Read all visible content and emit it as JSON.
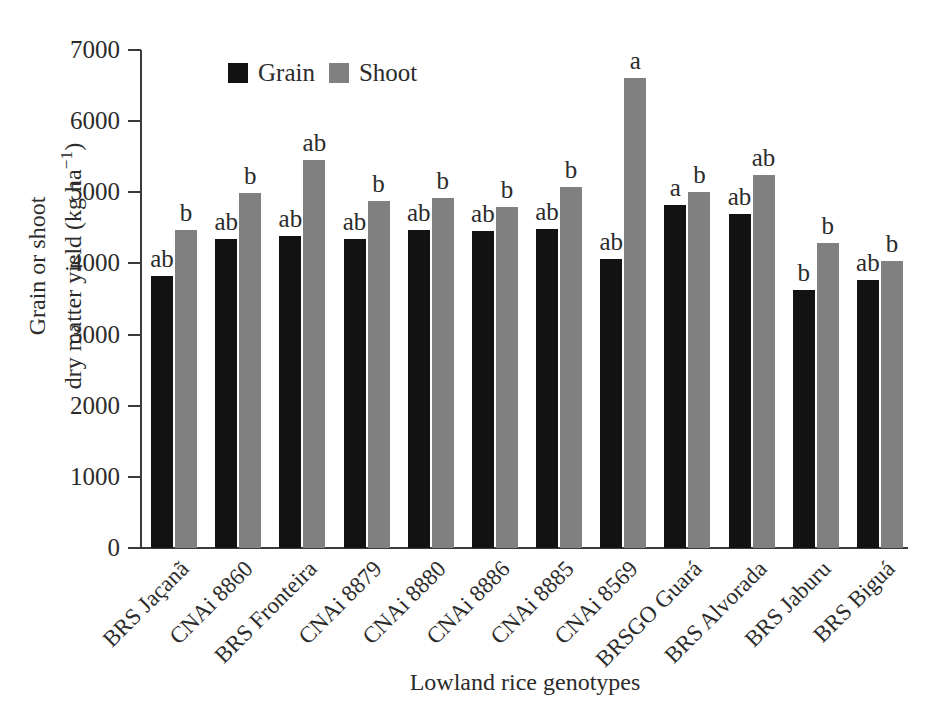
{
  "chart_data": {
    "type": "bar",
    "title": "",
    "xlabel": "Lowland rice genotypes",
    "ylabel_line1": "Grain or shoot",
    "ylabel_line2_pre": "dry matter yield (kg ha",
    "ylabel_line2_sup": "−1",
    "ylabel_line2_post": ")",
    "ylim": [
      0,
      7000
    ],
    "yticks": [
      0,
      1000,
      2000,
      3000,
      4000,
      5000,
      6000,
      7000
    ],
    "ytick_labels": [
      "0",
      "1000",
      "2000",
      "3000",
      "4000",
      "5000",
      "6000",
      "7000"
    ],
    "grid": false,
    "legend_position": "top-left-inside",
    "categories": [
      "BRS Jaçanã",
      "CNAi 8860",
      "BRS Fronteira",
      "CNAi 8879",
      "CNAi 8880",
      "CNAi 8886",
      "CNAi 8885",
      "CNAi 8569",
      "BRSGO Guará",
      "BRS Alvorada",
      "BRS Jaburu",
      "BRS Biguá"
    ],
    "series": [
      {
        "name": "Grain",
        "color": "#121212",
        "values": [
          3820,
          4340,
          4380,
          4350,
          4470,
          4450,
          4490,
          4060,
          4820,
          4700,
          3620,
          3770
        ],
        "letters": [
          "ab",
          "ab",
          "ab",
          "ab",
          "ab",
          "ab",
          "ab",
          "ab",
          "a",
          "ab",
          "b",
          "ab"
        ]
      },
      {
        "name": "Shoot",
        "color": "#808080",
        "values": [
          4470,
          4990,
          5460,
          4880,
          4920,
          4800,
          5070,
          6600,
          5000,
          5240,
          4290,
          4030
        ],
        "letters": [
          "b",
          "b",
          "ab",
          "b",
          "b",
          "b",
          "b",
          "a",
          "b",
          "ab",
          "b",
          "b"
        ]
      }
    ]
  },
  "legend": {
    "entries": [
      {
        "label": "Grain",
        "swatch": "grain-swatch-icon"
      },
      {
        "label": "Shoot",
        "swatch": "shoot-swatch-icon"
      }
    ]
  }
}
